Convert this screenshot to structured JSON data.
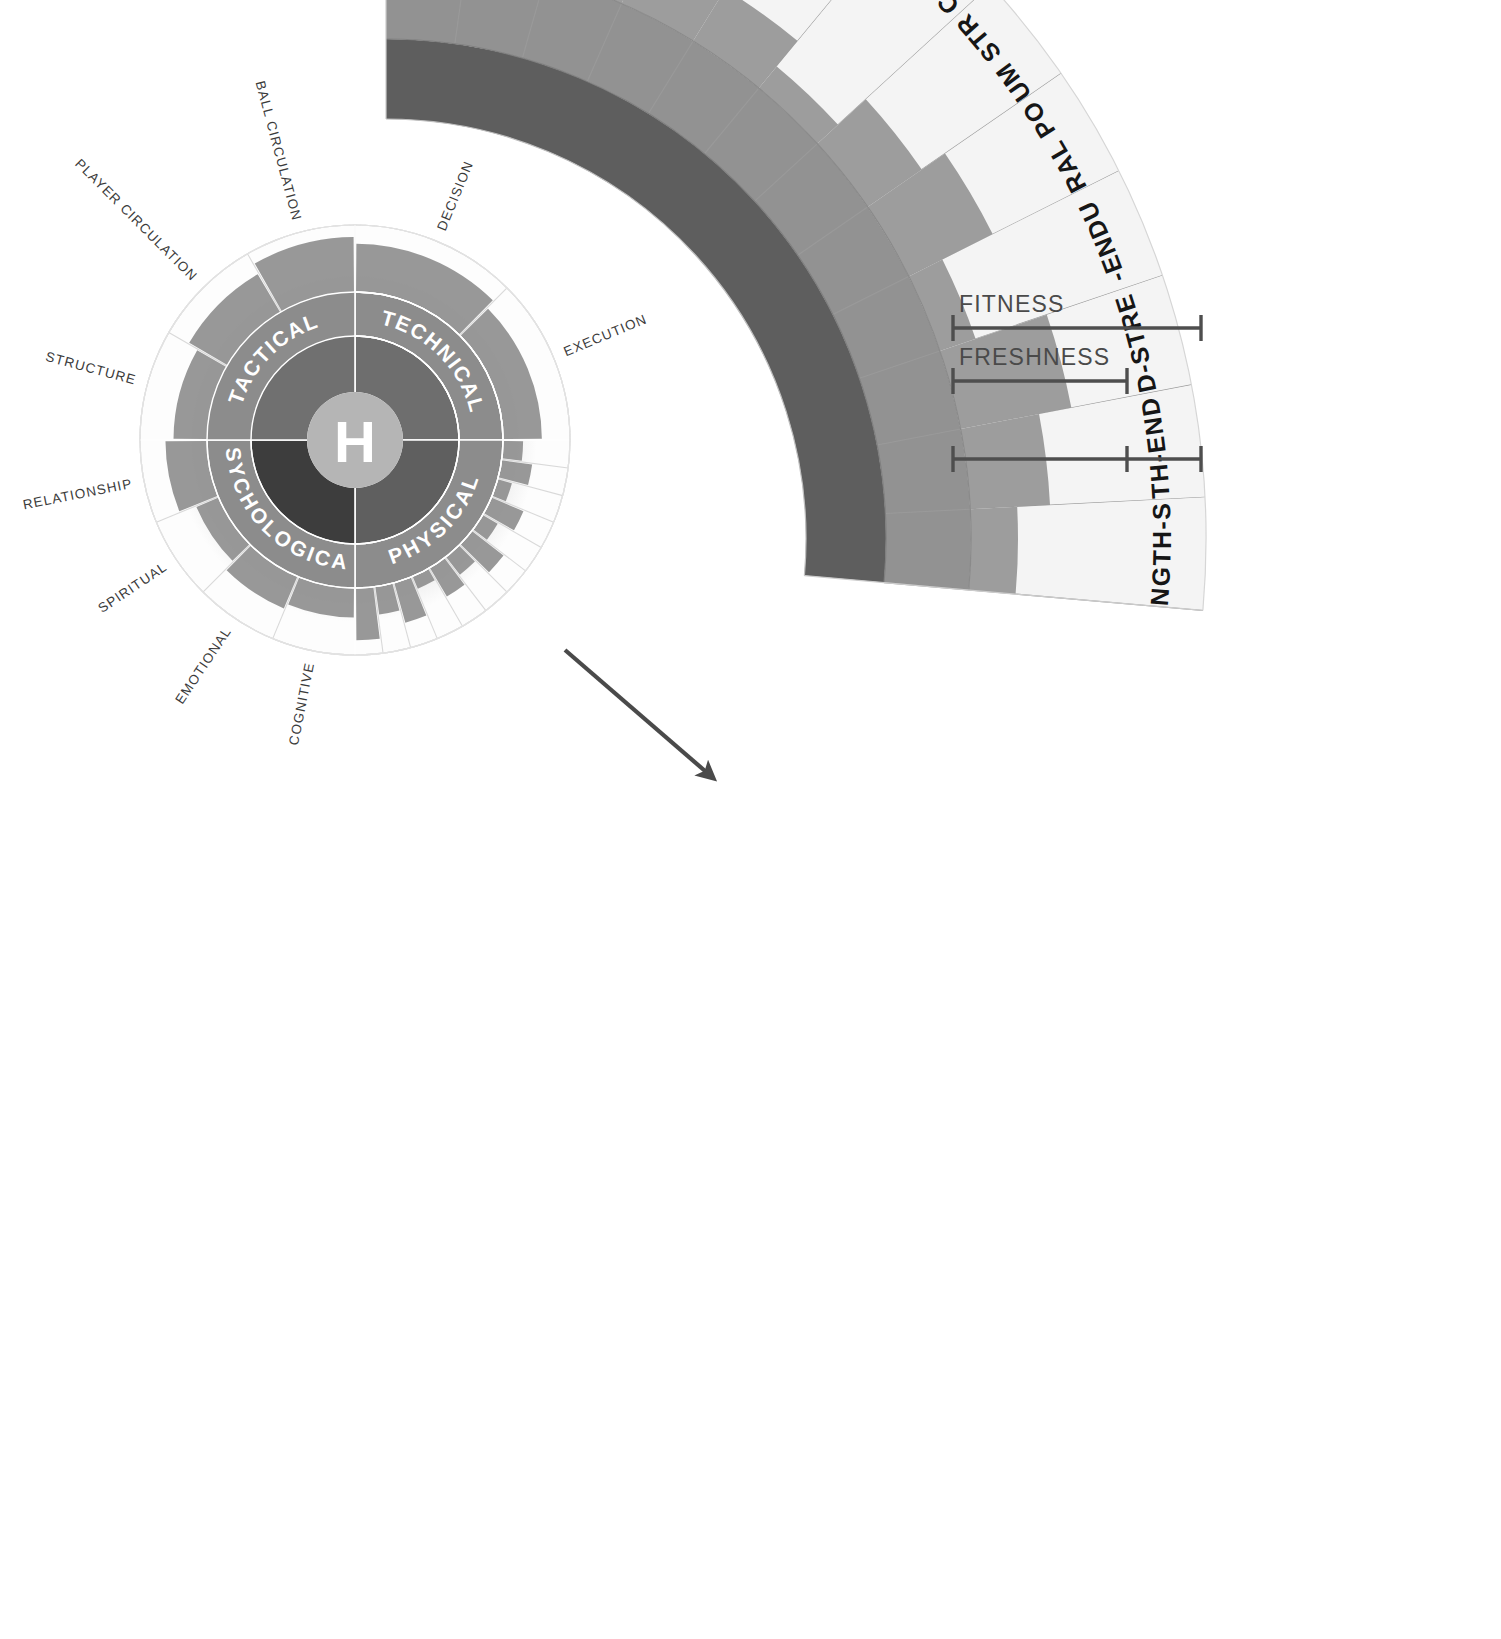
{
  "diagram": {
    "title_hub": "H",
    "hub_letter": "H"
  },
  "wheel": {
    "center": {
      "x": 355,
      "y": 440
    },
    "radii": {
      "hub": 48,
      "inner": 104,
      "mid": 148,
      "outer": 215
    },
    "quadrants": [
      {
        "key": "technical",
        "label": "TECHNICAL",
        "start_deg": -90,
        "end_deg": 0,
        "inner_color": "#6e6e6e",
        "mid_color": "#8c8c8c",
        "children": [
          {
            "label": "DECISION",
            "value": 0.72
          },
          {
            "label": "EXECUTION",
            "value": 0.58
          }
        ]
      },
      {
        "key": "physical",
        "label": "PHYSICAL",
        "start_deg": 0,
        "end_deg": 90,
        "inner_color": "#5f5f5f",
        "mid_color": "#8c8c8c",
        "children": [
          {
            "label": "AEROBIC POWER",
            "value": 0.3
          },
          {
            "label": "AEROBIC CAPACITY",
            "value": 0.46
          },
          {
            "label": "ANAEROBIC CAPACITY",
            "value": 0.22
          },
          {
            "label": "ANAEROBIC POWER",
            "value": 0.52
          },
          {
            "label": "EXPLOSIVENESS",
            "value": 0.26
          },
          {
            "label": "ISOMETRIC CONTRACTION",
            "value": 0.6
          },
          {
            "label": "MAXIMUM STRENGTH",
            "value": 0.34
          },
          {
            "label": "NEURAL POWER",
            "value": 0.5
          },
          {
            "label": "SPEED-ENDURANCE",
            "value": 0.2
          },
          {
            "label": "SPEED-STRENGTH",
            "value": 0.62
          },
          {
            "label": "STRENGTH-ENDURANCE",
            "value": 0.42
          },
          {
            "label": "STRENGTH-SPEED",
            "value": 0.78
          }
        ]
      },
      {
        "key": "psychological",
        "label": "PSYCHOLOGICAL",
        "start_deg": 90,
        "end_deg": 180,
        "inner_color": "#3d3d3d",
        "mid_color": "#8c8c8c",
        "children": [
          {
            "label": "COGNITIVE",
            "value": 0.44
          },
          {
            "label": "EMOTIONAL",
            "value": 0.52
          },
          {
            "label": "SPIRITUAL",
            "value": 0.36
          },
          {
            "label": "RELATIONSHIP",
            "value": 0.62
          }
        ]
      },
      {
        "key": "tactical",
        "label": "TACTICAL",
        "start_deg": 180,
        "end_deg": 270,
        "inner_color": "#707070",
        "mid_color": "#8c8c8c",
        "children": [
          {
            "label": "STRUCTURE",
            "value": 0.5
          },
          {
            "label": "PLAYER CIRCULATION",
            "value": 0.66
          },
          {
            "label": "BALL CIRCULATION",
            "value": 0.82
          }
        ]
      }
    ]
  },
  "fan": {
    "center": {
      "x": 386,
      "y": 539
    },
    "radii": {
      "inner": 420,
      "band_mid": 500,
      "band_outer": 585,
      "outer": 820
    },
    "start_deg": -90,
    "end_deg": 5,
    "colors": {
      "inner_band": "#5e5e5e",
      "mid_band": "#929292",
      "segment_fill": "#9d9d9d",
      "segment_empty": "#f4f4f4"
    },
    "segments": [
      {
        "label": "AEROBIC POWER",
        "value": 0.62
      },
      {
        "label": "AEROBIC CAPACITY",
        "value": 0.42
      },
      {
        "label": "ANAEROBIC CAPACITY",
        "value": 0.3
      },
      {
        "label": "ANAEROBIC POWER",
        "value": 0.5
      },
      {
        "label": "EXPLOSIVENESS",
        "value": 0.26
      },
      {
        "label": "ISOMETRIC CONTRACTION",
        "value": 0.12
      },
      {
        "label": "MAXIMUM STRENGTH",
        "value": 0.28
      },
      {
        "label": "NEURAL POWER",
        "value": 0.4
      },
      {
        "label": "SPEED-ENDURANCE",
        "value": 0.16
      },
      {
        "label": "SPEED-STRENGTH",
        "value": 0.48
      },
      {
        "label": "STRENGTH-ENDURANCE",
        "value": 0.34
      },
      {
        "label": "STRENGTH-SPEED",
        "value": 0.2
      }
    ]
  },
  "scales": [
    {
      "key": "fitness",
      "label": "FITNESS",
      "x_start": 953,
      "x_end": 1201,
      "y": 328,
      "tick": null
    },
    {
      "key": "freshness",
      "label": "FRESHNESS",
      "x_start": 953,
      "x_end": 1127,
      "y": 381,
      "tick": null
    },
    {
      "key": "unlabeled",
      "label": "",
      "x_start": 953,
      "x_end": 1201,
      "y": 459,
      "tick": 1127
    }
  ],
  "connector": {
    "from": {
      "x": 565,
      "y": 650
    },
    "to": {
      "x": 712,
      "y": 777
    }
  }
}
